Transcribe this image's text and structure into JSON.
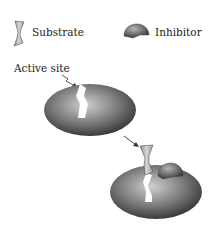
{
  "legend": {
    "substrate_label": "Substrate",
    "inhibitor_label": "Inhibitor"
  },
  "annotations": {
    "active_site_label": "Active site"
  },
  "colors": {
    "enzyme_light": "#bdbdbd",
    "enzyme_dark": "#3a3a3a",
    "substrate": "#a9a9a9",
    "inhibitor": "#6f6f6f"
  }
}
